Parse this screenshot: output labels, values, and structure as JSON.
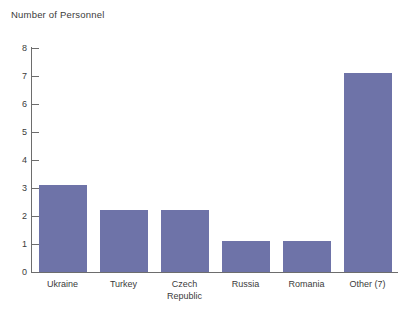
{
  "chart_data": {
    "type": "bar",
    "title": "Number of Personnel",
    "xlabel": "",
    "ylabel": "Number of Personnel",
    "categories": [
      "Ukraine",
      "Turkey",
      "Czech\nRepublic",
      "Russia",
      "Romania",
      "Other (7)"
    ],
    "values": [
      3.1,
      2.2,
      2.2,
      1.1,
      1.1,
      7.1
    ],
    "ylim": [
      0,
      8
    ],
    "yticks": [
      0,
      1,
      2,
      3,
      4,
      5,
      6,
      7,
      8
    ],
    "ytick_labels": [
      "0",
      "1",
      "2",
      "3",
      "4",
      "5",
      "6",
      "7",
      "8"
    ],
    "grid": false,
    "legend": null,
    "series": [
      {
        "name": "Number of Personnel",
        "color": "#6e73a8",
        "values": [
          3.1,
          2.2,
          2.2,
          1.1,
          1.1,
          7.1
        ]
      }
    ],
    "colors": {
      "bar": "#6e73a8",
      "axis": "#6d6d6d",
      "text": "#3b3b3b",
      "background": "#ffffff"
    }
  }
}
